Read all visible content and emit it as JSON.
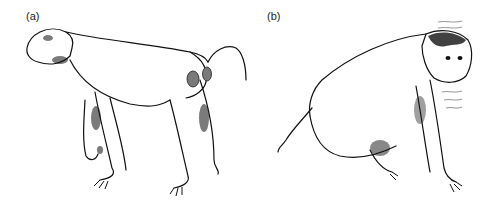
{
  "figure": {
    "panels": [
      {
        "label": "(a)",
        "description": "Monkey walking in quadrupedal posture with tail raised, showing gray patches on hindquarters"
      },
      {
        "label": "(b)",
        "description": "Monkey in crouched posture with tail lowered, head turned toward viewer, with shaking/vibration lines near head"
      }
    ],
    "colors": {
      "ink": "#111111",
      "patch": "#7a7a7a",
      "shake_lines": "#9a9a9a",
      "background": "#ffffff"
    }
  }
}
